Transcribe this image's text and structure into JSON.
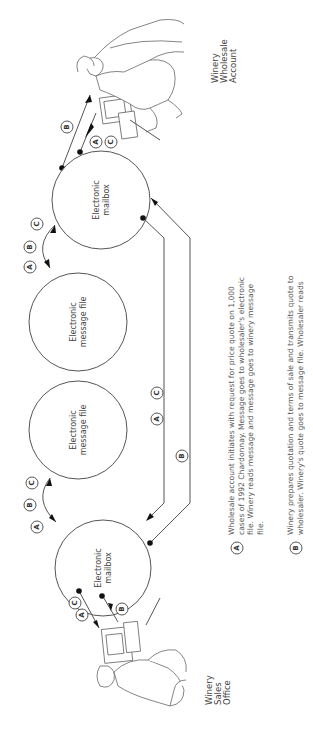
{
  "diagram": {
    "orientation": "rotated-90",
    "nodes": {
      "mailbox_top": {
        "label_line1": "Electronic",
        "label_line2": "mailbox"
      },
      "message_file_top": {
        "label_line1": "Electronic",
        "label_line2": "message file"
      },
      "message_file_bottom": {
        "label_line1": "Electronic",
        "label_line2": "message file"
      },
      "mailbox_bottom": {
        "label_line1": "Electronic",
        "label_line2": "mailbox"
      }
    },
    "locations": {
      "wholesale": {
        "line1": "Winery",
        "line2": "Wholesale",
        "line3": "Account"
      },
      "sales": {
        "line1": "Winery",
        "line2": "Sales",
        "line3": "Office"
      }
    },
    "flow_labels": {
      "a": "A",
      "b": "B",
      "c": "C"
    },
    "legend": [
      {
        "key": "A",
        "lines": [
          "Wholesale account initiates with request for price quote on 1,000",
          "cases of 1992 Chardonnay. Message goes to wholesaler's electronic",
          "file. Winery reads message and message goes to winery message",
          "file."
        ]
      },
      {
        "key": "B",
        "lines": [
          "Winery prepares quotation and terms of sale and transmits quote to",
          "wholesaler. Winery's quote goes to message file. Wholesaler reads"
        ]
      }
    ]
  }
}
